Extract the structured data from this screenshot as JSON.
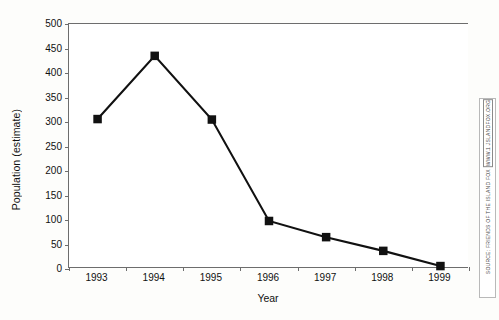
{
  "chart_data": {
    "type": "line",
    "title": "",
    "subtitle": "",
    "xlabel": "Year",
    "ylabel": "Population (estimate)",
    "categories": [
      "1993",
      "1994",
      "1995",
      "1996",
      "1997",
      "1998",
      "1999"
    ],
    "values": [
      306,
      435,
      305,
      98,
      65,
      37,
      6
    ],
    "series": [
      {
        "name": "Population (estimate)",
        "values": [
          306,
          435,
          305,
          98,
          65,
          37,
          6
        ]
      }
    ],
    "ylim": [
      0,
      500
    ],
    "yticks": [
      0,
      50,
      100,
      150,
      200,
      250,
      300,
      350,
      400,
      450,
      500
    ],
    "ytick_labels": [
      "0",
      "50",
      "100",
      "150",
      "200",
      "250",
      "300",
      "350",
      "400",
      "450",
      "500"
    ],
    "xtick_labels": [
      "1993",
      "1994",
      "1995",
      "1996",
      "1997",
      "1998",
      "1999"
    ],
    "grid": false,
    "legend": false,
    "legend_position": "none",
    "marker": "square",
    "line_color": "#111111",
    "marker_color": "#111111",
    "axis_color": "#6d6d6d",
    "background_color": "#ffffff",
    "annotations": []
  },
  "source_note": {
    "prefix": "SOURCE: FRIENDS OF THE ISLAND FOX",
    "url": "WWW.1 JSLANDFOX.ORG",
    "full": "SOURCE: FRIENDS OF THE ISLAND FOX [WWW.1 JSLANDFOX.ORG]"
  }
}
